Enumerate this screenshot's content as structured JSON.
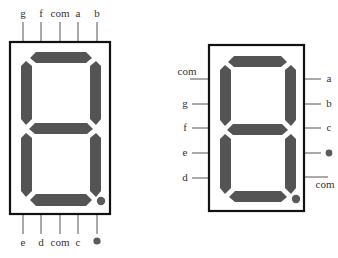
{
  "left_display": {
    "top_pins": [
      "g",
      "f",
      "com",
      "a",
      "b"
    ],
    "bottom_pins": [
      "e",
      "d",
      "com",
      "c",
      "dp"
    ],
    "bottom_dp_symbol": "●"
  },
  "right_display": {
    "left_pins": [
      "com",
      "g",
      "f",
      "e",
      "d"
    ],
    "right_pins": [
      "a",
      "b",
      "c",
      "dp",
      "com"
    ],
    "right_dp_symbol": "●"
  },
  "colors": {
    "segment": "#545454",
    "frame": "#111111",
    "label": "#333333"
  },
  "caption": ""
}
